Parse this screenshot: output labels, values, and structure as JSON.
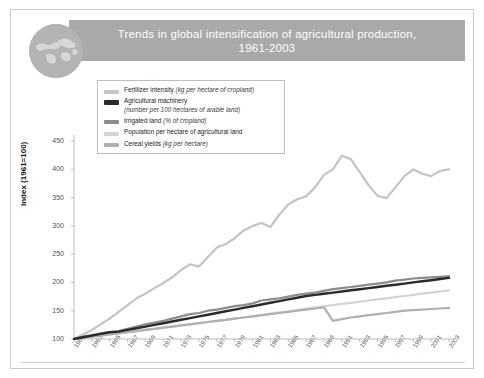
{
  "card": {
    "frame_color": "#c9c9c9"
  },
  "header": {
    "title_line1": "Trends in global intensification of agricultural production,",
    "title_line2": "1961-2003",
    "band_color": "#a9a9a9",
    "globe_icon": "globe-icon"
  },
  "legend": {
    "items": [
      {
        "label": "Fertilizer intensity ",
        "note": "(kg per hectare of cropland)",
        "sub": "",
        "color": "#c4c4c4"
      },
      {
        "label": "Agricultural machinery",
        "note": "",
        "sub": "(number per 100 hectares of arable land)",
        "color": "#2a2a2a"
      },
      {
        "label": "Irrigated land ",
        "note": "(% of cropland)",
        "sub": "",
        "color": "#8c8c8c"
      },
      {
        "label": "Population per hectare of agricultural land",
        "note": "",
        "sub": "",
        "color": "#d4d4d4"
      },
      {
        "label": "Cereal yields ",
        "note": "(kg per hectare)",
        "sub": "",
        "color": "#b0b0b0"
      }
    ]
  },
  "axes": {
    "ylabel": "Index (1961=100)",
    "yticks": [
      450,
      400,
      350,
      300,
      250,
      200,
      150,
      100
    ],
    "ylim": [
      100,
      450
    ],
    "xticks": [
      "1961",
      "1963",
      "1965",
      "1967",
      "1969",
      "1971",
      "1973",
      "1975",
      "1977",
      "1979",
      "1981",
      "1983",
      "1985",
      "1987",
      "1989",
      "1991",
      "1993",
      "1995",
      "1997",
      "1999",
      "2001",
      "2003"
    ],
    "xlim": [
      1961,
      2003
    ]
  },
  "chart_data": {
    "type": "line",
    "title": "Trends in global intensification of agricultural production, 1961-2003",
    "xlabel": "",
    "ylabel": "Index (1961=100)",
    "ylim": [
      100,
      450
    ],
    "xlim": [
      1961,
      2003
    ],
    "grid": false,
    "legend_position": "top-left-inside",
    "x": [
      1961,
      1962,
      1963,
      1964,
      1965,
      1966,
      1967,
      1968,
      1969,
      1970,
      1971,
      1972,
      1973,
      1974,
      1975,
      1976,
      1977,
      1978,
      1979,
      1980,
      1981,
      1982,
      1983,
      1984,
      1985,
      1986,
      1987,
      1988,
      1989,
      1990,
      1991,
      1992,
      1993,
      1994,
      1995,
      1996,
      1997,
      1998,
      1999,
      2000,
      2001,
      2002,
      2003
    ],
    "series": [
      {
        "name": "Fertilizer intensity (kg per hectare of cropland)",
        "color": "#c4c4c4",
        "values": [
          100,
          108,
          116,
          126,
          136,
          148,
          160,
          172,
          180,
          190,
          199,
          209,
          222,
          232,
          228,
          245,
          262,
          268,
          278,
          292,
          300,
          305,
          298,
          320,
          338,
          347,
          352,
          368,
          390,
          400,
          424,
          418,
          395,
          372,
          353,
          349,
          368,
          388,
          400,
          392,
          388,
          397,
          400
        ]
      },
      {
        "name": "Agricultural machinery (number per 100 hectares of arable land)",
        "color": "#2a2a2a",
        "values": [
          100,
          103,
          106,
          109,
          112,
          113,
          116,
          119,
          122,
          125,
          128,
          131,
          134,
          137,
          140,
          143,
          146,
          149,
          152,
          155,
          158,
          161,
          164,
          167,
          170,
          173,
          176,
          178,
          180,
          182,
          184,
          186,
          188,
          190,
          192,
          194,
          196,
          198,
          200,
          202,
          204,
          206,
          208
        ]
      },
      {
        "name": "Irrigated land (% of cropland)",
        "color": "#8c8c8c",
        "values": [
          100,
          104,
          107,
          110,
          112,
          114,
          118,
          122,
          126,
          129,
          132,
          136,
          140,
          144,
          146,
          150,
          152,
          155,
          158,
          160,
          163,
          168,
          170,
          172,
          175,
          178,
          180,
          182,
          185,
          188,
          190,
          192,
          194,
          196,
          198,
          200,
          203,
          205,
          207,
          208,
          209,
          210,
          211
        ]
      },
      {
        "name": "Population per hectare of agricultural land",
        "color": "#d4d4d4",
        "values": [
          100,
          102,
          104,
          106,
          108,
          110,
          112,
          114,
          116,
          118,
          120,
          122,
          124,
          126,
          128,
          130,
          132,
          134,
          136,
          138,
          140,
          142,
          145,
          147,
          149,
          151,
          154,
          156,
          158,
          160,
          162,
          164,
          166,
          168,
          170,
          172,
          174,
          176,
          178,
          180,
          182,
          184,
          186
        ]
      },
      {
        "name": "Cereal yields (kg per hectare)",
        "color": "#b0b0b0",
        "values": [
          100,
          102,
          104,
          106,
          108,
          110,
          112,
          114,
          116,
          118,
          120,
          122,
          124,
          126,
          128,
          130,
          132,
          134,
          136,
          138,
          140,
          142,
          144,
          146,
          148,
          150,
          152,
          154,
          156,
          132,
          135,
          138,
          140,
          142,
          144,
          146,
          148,
          150,
          151,
          152,
          153,
          154,
          155
        ]
      }
    ]
  }
}
